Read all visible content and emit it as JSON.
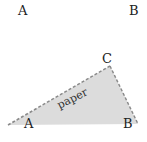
{
  "diagram": {
    "top_labels": [
      {
        "text": "A",
        "x": 23,
        "y": 15
      },
      {
        "text": "B",
        "x": 134,
        "y": 15
      }
    ],
    "triangle": {
      "vertices": {
        "C": [
          110,
          66
        ],
        "left": [
          8,
          125
        ],
        "B": [
          138,
          124
        ]
      },
      "fill": "#dcdcdc",
      "edge_color": "#8a8a8a",
      "labels": [
        {
          "text": "C",
          "x": 107,
          "y": 62
        },
        {
          "text": "A",
          "x": 29,
          "y": 128
        },
        {
          "text": "B",
          "x": 128,
          "y": 128
        }
      ],
      "surface_label": {
        "text": "paper",
        "x": 72,
        "y": 96,
        "angle": -27
      }
    }
  }
}
